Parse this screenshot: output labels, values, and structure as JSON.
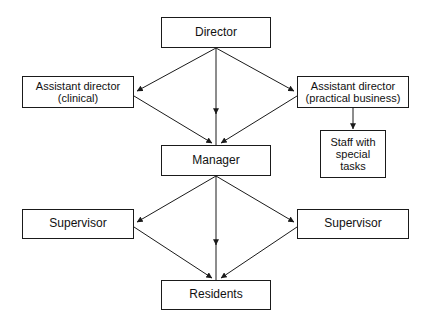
{
  "diagram": {
    "type": "organizational-hierarchy-chart",
    "background_color": "#ffffff",
    "line_color": "#1a1a1a",
    "text_color": "#111111",
    "nodes": [
      {
        "id": "director",
        "label": "Director"
      },
      {
        "id": "asst_clinical",
        "label": "Assistant director\n(clinical)"
      },
      {
        "id": "asst_practical",
        "label": "Assistant director\n(practical business)"
      },
      {
        "id": "staff",
        "label": "Staff with\nspecial\ntasks"
      },
      {
        "id": "manager",
        "label": "Manager"
      },
      {
        "id": "supervisor_left",
        "label": "Supervisor"
      },
      {
        "id": "supervisor_right",
        "label": "Supervisor"
      },
      {
        "id": "residents",
        "label": "Residents"
      }
    ],
    "edges": [
      {
        "from": "director",
        "to": "asst_clinical",
        "arrow": "single"
      },
      {
        "from": "director",
        "to": "asst_practical",
        "arrow": "single"
      },
      {
        "from": "director",
        "to": "manager",
        "arrow": "single"
      },
      {
        "from": "asst_clinical",
        "to": "manager",
        "arrow": "single"
      },
      {
        "from": "asst_practical",
        "to": "manager",
        "arrow": "single"
      },
      {
        "from": "asst_practical",
        "to": "staff",
        "arrow": "single"
      },
      {
        "from": "manager",
        "to": "supervisor_left",
        "arrow": "single"
      },
      {
        "from": "manager",
        "to": "supervisor_right",
        "arrow": "single"
      },
      {
        "from": "manager",
        "to": "residents",
        "arrow": "single"
      },
      {
        "from": "supervisor_left",
        "to": "residents",
        "arrow": "single"
      },
      {
        "from": "supervisor_right",
        "to": "residents",
        "arrow": "single"
      }
    ]
  }
}
